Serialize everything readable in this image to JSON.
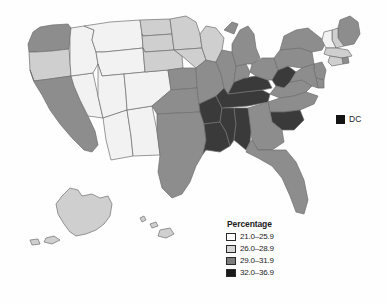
{
  "map": {
    "title": "",
    "dc_marker": {
      "label": "DC",
      "class": "32.0-36.9"
    },
    "legend": {
      "title": "Percentage",
      "items": [
        {
          "label": "21.0–25.9",
          "swatch": "white",
          "color": "#ffffff"
        },
        {
          "label": "26.0–28.9",
          "swatch": "light-gray",
          "color": "#d6d6d6"
        },
        {
          "label": "29.0–31.9",
          "swatch": "dark-gray",
          "color": "#7d7d7d"
        },
        {
          "label": "32.0–36.9",
          "swatch": "black",
          "color": "#1a1a1a"
        }
      ]
    },
    "states": [
      {
        "code": "WA",
        "class": 3
      },
      {
        "code": "OR",
        "class": 2
      },
      {
        "code": "CA",
        "class": 3
      },
      {
        "code": "NV",
        "class": 1
      },
      {
        "code": "ID",
        "class": 1
      },
      {
        "code": "MT",
        "class": 1
      },
      {
        "code": "WY",
        "class": 1
      },
      {
        "code": "UT",
        "class": 1
      },
      {
        "code": "AZ",
        "class": 1
      },
      {
        "code": "NM",
        "class": 1
      },
      {
        "code": "CO",
        "class": 1
      },
      {
        "code": "ND",
        "class": 2
      },
      {
        "code": "SD",
        "class": 2
      },
      {
        "code": "NE",
        "class": 2
      },
      {
        "code": "KS",
        "class": 3
      },
      {
        "code": "OK",
        "class": 3
      },
      {
        "code": "TX",
        "class": 3
      },
      {
        "code": "MN",
        "class": 2
      },
      {
        "code": "IA",
        "class": 2
      },
      {
        "code": "MO",
        "class": 3
      },
      {
        "code": "AR",
        "class": 4
      },
      {
        "code": "LA",
        "class": 4
      },
      {
        "code": "WI",
        "class": 2
      },
      {
        "code": "IL",
        "class": 3
      },
      {
        "code": "MS",
        "class": 4
      },
      {
        "code": "AL",
        "class": 4
      },
      {
        "code": "TN",
        "class": 4
      },
      {
        "code": "KY",
        "class": 4
      },
      {
        "code": "IN",
        "class": 3
      },
      {
        "code": "MI",
        "class": 3
      },
      {
        "code": "OH",
        "class": 3
      },
      {
        "code": "WV",
        "class": 4
      },
      {
        "code": "VA",
        "class": 3
      },
      {
        "code": "NC",
        "class": 3
      },
      {
        "code": "SC",
        "class": 4
      },
      {
        "code": "GA",
        "class": 3
      },
      {
        "code": "FL",
        "class": 3
      },
      {
        "code": "PA",
        "class": 3
      },
      {
        "code": "NY",
        "class": 3
      },
      {
        "code": "ME",
        "class": 3
      },
      {
        "code": "NH",
        "class": 2
      },
      {
        "code": "VT",
        "class": 1
      },
      {
        "code": "MA",
        "class": 2
      },
      {
        "code": "RI",
        "class": 3
      },
      {
        "code": "CT",
        "class": 2
      },
      {
        "code": "NJ",
        "class": 3
      },
      {
        "code": "DE",
        "class": 3
      },
      {
        "code": "MD",
        "class": 3
      },
      {
        "code": "AK",
        "class": 2
      },
      {
        "code": "HI",
        "class": 2
      }
    ]
  }
}
